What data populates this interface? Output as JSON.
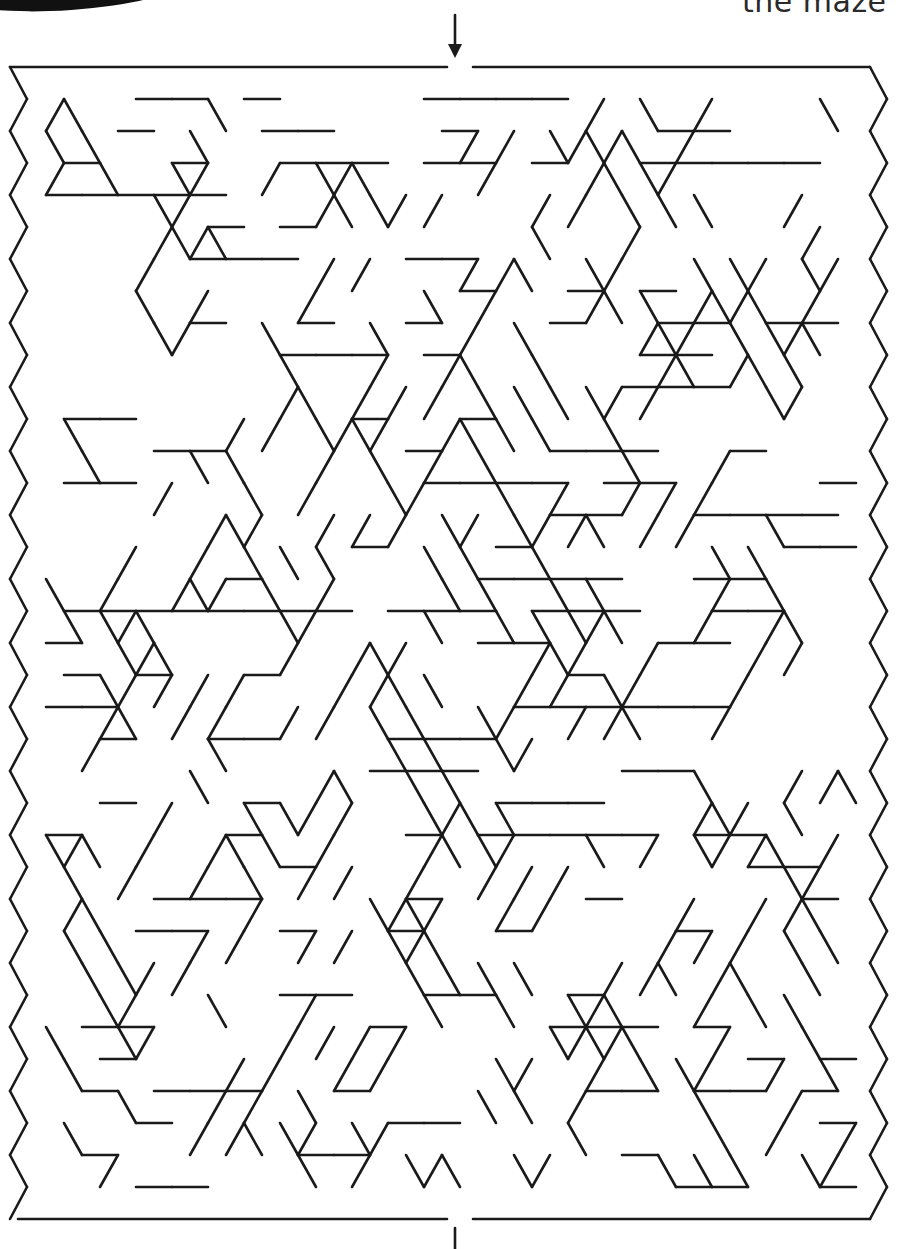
{
  "caption": {
    "text": "the maze"
  },
  "maze": {
    "type": "triangular-lattice maze",
    "origin_x": 10,
    "origin_y": 67,
    "col_spacing": 36,
    "row_spacing": 32,
    "rows": 36,
    "cols": 24,
    "stroke_color": "#1a1a1a",
    "stroke_width": 2.6,
    "seed": 7,
    "entrance": {
      "label": "start",
      "x_from": 447,
      "x_to": 473,
      "edge": "top"
    },
    "exit": {
      "label": "finish",
      "x_from": 447,
      "x_to": 473,
      "edge": "bottom"
    },
    "start_arrow": {
      "x": 455,
      "y_from": 15,
      "y_to": 58,
      "direction": "down"
    },
    "exit_marker": {
      "x": 455,
      "y_from": 1228,
      "y_to": 1249
    }
  }
}
